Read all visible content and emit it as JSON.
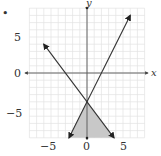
{
  "chart_data": {
    "type": "line",
    "title": "",
    "xlabel": "x",
    "ylabel": "y",
    "xlim": [
      -8,
      8
    ],
    "ylim": [
      -9,
      9
    ],
    "grid": true,
    "x_tick_labels": [
      "-5",
      "0",
      "5"
    ],
    "y_tick_labels": [
      "5",
      "0",
      "-5"
    ],
    "series": [
      {
        "name": "line-rising",
        "equation": "y = 2x - 4",
        "points": [
          [
            -2.5,
            -9
          ],
          [
            6,
            8
          ]
        ]
      },
      {
        "name": "line-falling",
        "equation": "y = -4/3x - 4",
        "points": [
          [
            -6,
            4
          ],
          [
            3.75,
            -9
          ]
        ]
      }
    ],
    "shaded_region": {
      "description": "triangle below intersection bounded by both lines",
      "vertices": [
        [
          0,
          -4
        ],
        [
          -2.5,
          -9
        ],
        [
          3.75,
          -9
        ]
      ],
      "color": "#c8c8c8"
    },
    "intersection": [
      0,
      -4
    ]
  },
  "labels": {
    "x_axis": "x",
    "y_axis": "y",
    "tick_x_neg5": "−5",
    "tick_x_0": "0",
    "tick_x_5": "5",
    "tick_y_5": "5",
    "tick_y_0": "0",
    "tick_y_neg5": "−5",
    "bullet": "•"
  },
  "colors": {
    "grid": "#e3e3e3",
    "axis": "#555555",
    "line": "#333333",
    "shade": "#c8c8c8"
  }
}
